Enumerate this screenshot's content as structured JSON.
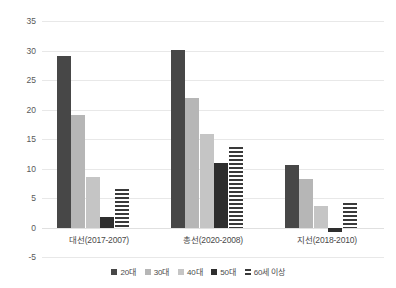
{
  "chart_data": {
    "type": "bar",
    "title": "",
    "subtitle": "",
    "xlabel": "",
    "ylabel": "",
    "ylim": [
      -5,
      35
    ],
    "yticks": [
      35,
      30,
      25,
      20,
      15,
      10,
      5,
      0,
      -5
    ],
    "grid": true,
    "legend_position": "bottom",
    "categories": [
      "대선(2017-2007)",
      "총선(2020-2008)",
      "지선(2018-2010)"
    ],
    "series": [
      {
        "name": "20대",
        "color": "#474747",
        "pattern": "solid",
        "values": [
          29.0,
          30.1,
          10.6
        ]
      },
      {
        "name": "30대",
        "color": "#b6b6b6",
        "pattern": "solid",
        "values": [
          19.1,
          21.9,
          8.2
        ]
      },
      {
        "name": "40대",
        "color": "#c5c5c5",
        "pattern": "solid",
        "values": [
          8.5,
          15.8,
          3.7
        ]
      },
      {
        "name": "50대",
        "color": "#2e2e2e",
        "pattern": "solid",
        "values": [
          1.8,
          11.0,
          -0.7
        ]
      },
      {
        "name": "60세 이상",
        "color": "#3a3a3a",
        "pattern": "horizontal-stripes",
        "values": [
          6.5,
          13.7,
          4.2
        ]
      }
    ]
  },
  "axis": {
    "tick_labels": [
      "35",
      "30",
      "25",
      "20",
      "15",
      "10",
      "5",
      "0",
      "-5"
    ],
    "category_labels": [
      "대선(2017-2007)",
      "총선(2020-2008)",
      "지선(2018-2010)"
    ]
  },
  "legend": {
    "items": [
      {
        "label": "20대"
      },
      {
        "label": "30대"
      },
      {
        "label": "40대"
      },
      {
        "label": "50대"
      },
      {
        "label": "60세 이상"
      }
    ]
  }
}
